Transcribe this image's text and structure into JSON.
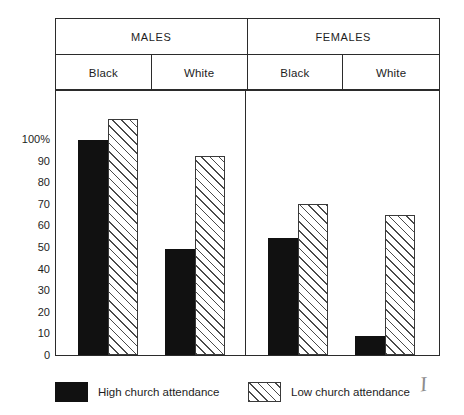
{
  "chart_data": {
    "type": "bar",
    "title": "",
    "xlabel": "",
    "ylabel": "",
    "ylim": [
      0,
      100
    ],
    "grid": false,
    "legend_position": "bottom",
    "yticks": [
      "100%",
      "90",
      "80",
      "70",
      "60",
      "50",
      "40",
      "30",
      "20",
      "10",
      "0"
    ],
    "ytick_values": [
      100,
      90,
      80,
      70,
      60,
      50,
      40,
      30,
      20,
      10,
      0
    ],
    "group_headers": [
      "MALES",
      "FEMALES"
    ],
    "categories": [
      "Black",
      "White",
      "Black",
      "White"
    ],
    "series": [
      {
        "name": "High church attendance",
        "values": [
          81,
          40,
          44,
          7
        ],
        "fill": "solid-black"
      },
      {
        "name": "Low church attendance",
        "values": [
          89,
          75,
          57,
          53
        ],
        "fill": "diagonal-hatch"
      }
    ],
    "annotation": "I"
  },
  "header": {
    "groups": [
      {
        "label": "MALES",
        "columns": [
          "Black",
          "White"
        ]
      },
      {
        "label": "FEMALES",
        "columns": [
          "Black",
          "White"
        ]
      }
    ]
  },
  "legend": {
    "items": [
      {
        "label": "High church attendance",
        "swatch": "solid-black-swatch"
      },
      {
        "label": "Low church attendance",
        "swatch": "hatched-swatch"
      }
    ]
  },
  "colors": {
    "bar_solid": "#111111",
    "bar_hatch_line": "#4a4a4a",
    "axis": "#2b2b2b",
    "text": "#1d1d1d",
    "background": "#ffffff"
  }
}
